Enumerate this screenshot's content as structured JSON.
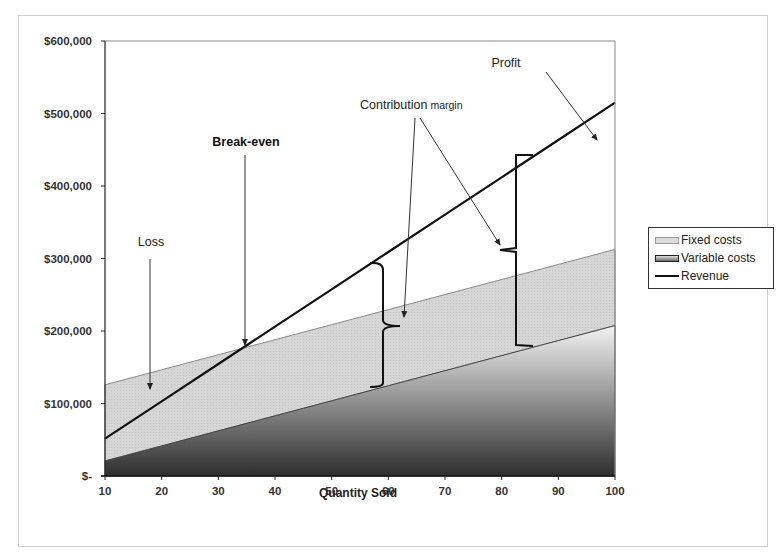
{
  "chart_data": {
    "type": "area",
    "title": "",
    "xlabel": "Quantity Sold",
    "ylabel": "",
    "x": [
      10,
      20,
      30,
      40,
      50,
      60,
      70,
      80,
      90,
      100
    ],
    "xlim": [
      10,
      100
    ],
    "ylim": [
      0,
      600000
    ],
    "x_ticks": [
      "10",
      "20",
      "30",
      "40",
      "50",
      "60",
      "70",
      "80",
      "90",
      "100"
    ],
    "y_ticks": [
      "$-",
      "$100,000",
      "$200,000",
      "$300,000",
      "$400,000",
      "$500,000",
      "$600,000"
    ],
    "y_tick_values": [
      0,
      100000,
      200000,
      300000,
      400000,
      500000,
      600000
    ],
    "grid": false,
    "legend_position": "right",
    "series": [
      {
        "name": "Fixed costs",
        "kind": "stacked-area",
        "values": [
          105000,
          105000,
          105000,
          105000,
          105000,
          105000,
          105000,
          105000,
          105000,
          105000
        ],
        "color": "#d9d9d9"
      },
      {
        "name": "Variable costs",
        "kind": "stacked-area-base",
        "values": [
          20750,
          41500,
          62250,
          83000,
          103750,
          124500,
          145250,
          166000,
          186750,
          207500
        ],
        "color": "#5a5a5a"
      },
      {
        "name": "Revenue",
        "kind": "line",
        "values": [
          51500,
          103000,
          154500,
          206000,
          257500,
          309000,
          360500,
          412000,
          463500,
          515000
        ],
        "color": "#111111"
      }
    ],
    "annotations": [
      {
        "text": "Loss",
        "x": 17,
        "y": 120000
      },
      {
        "text": "Break-even",
        "x": 34.1,
        "y": 175000
      },
      {
        "text": "Contribution margin",
        "targets": [
          60,
          82
        ]
      },
      {
        "text": "Profit",
        "x": 93,
        "y": 430000
      }
    ],
    "break_even_quantity": 34.1
  },
  "labels": {
    "loss": "Loss",
    "break_even": "Break-even",
    "contribution": "Contribution",
    "margin": "margin",
    "profit": "Profit"
  },
  "legend": {
    "items": [
      {
        "label": "Fixed costs",
        "icon": "fixed-costs-swatch"
      },
      {
        "label": "Variable costs",
        "icon": "variable-costs-swatch"
      },
      {
        "label": "Revenue",
        "icon": "revenue-line-swatch"
      }
    ]
  }
}
